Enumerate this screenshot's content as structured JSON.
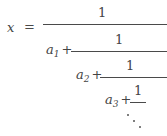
{
  "document": {
    "type": "mathematical-expression",
    "description": "continued fraction",
    "background_color": "#ffffff",
    "text_color": "#444444",
    "rule_color": "#4a4a4a"
  },
  "equation": {
    "variable": "x",
    "relation": "=",
    "numerators": [
      "1",
      "1",
      "1",
      "1"
    ],
    "denominator_terms": [
      {
        "base": "a",
        "subscript": "1",
        "operator": "+"
      },
      {
        "base": "a",
        "subscript": "2",
        "operator": "+"
      },
      {
        "base": "a",
        "subscript": "3",
        "operator": "+"
      }
    ],
    "continuation": "⋱",
    "plain_text": "x = 1/(a_1 + 1/(a_2 + 1/(a_3 + 1/...)))"
  }
}
